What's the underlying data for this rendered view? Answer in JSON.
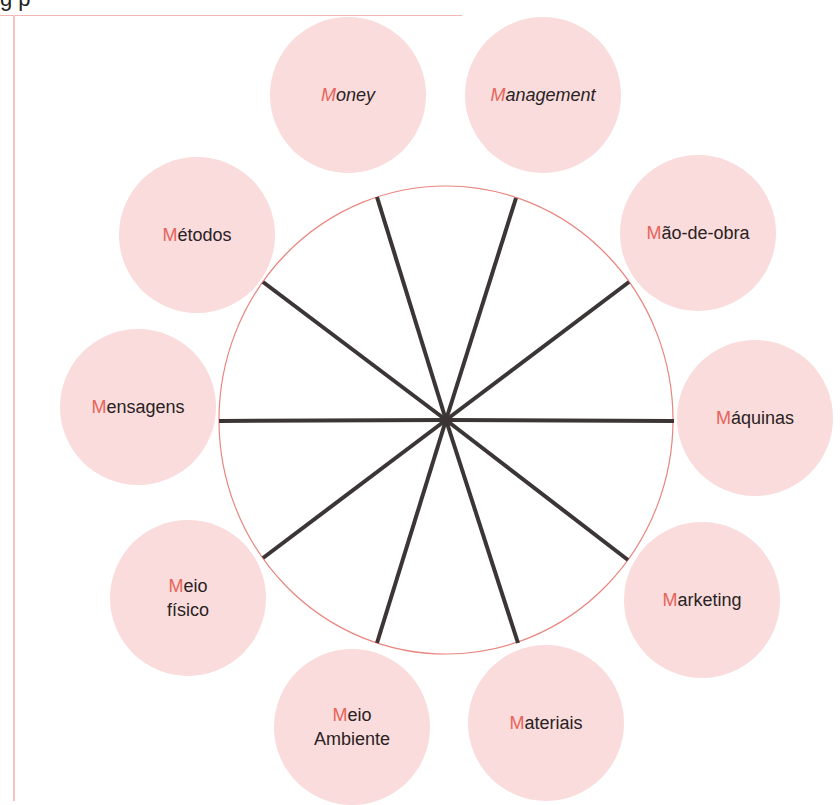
{
  "header": {
    "title_fragment": "g      p"
  },
  "colors": {
    "node_fill": "#f9dcdb",
    "accent_letter": "#e8635a",
    "text": "#2a2224",
    "ring_stroke": "#e8857f",
    "spoke": "#3b3536",
    "frame": "#f2b7b5"
  },
  "diagram": {
    "center": {
      "x": 446,
      "y": 420
    },
    "ring": {
      "rx": 227,
      "ry": 234
    },
    "nodes": [
      {
        "id": "money",
        "first": "M",
        "rest": "oney",
        "line2": "",
        "italic": true
      },
      {
        "id": "management",
        "first": "M",
        "rest": "anagement",
        "line2": "",
        "italic": true
      },
      {
        "id": "mao-de-obra",
        "first": "M",
        "rest": "ão-de-obra",
        "line2": "",
        "italic": false
      },
      {
        "id": "maquinas",
        "first": "M",
        "rest": "áquinas",
        "line2": "",
        "italic": false
      },
      {
        "id": "marketing",
        "first": "M",
        "rest": "arketing",
        "line2": "",
        "italic": false
      },
      {
        "id": "materiais",
        "first": "M",
        "rest": "ateriais",
        "line2": "",
        "italic": false
      },
      {
        "id": "meio-ambiente",
        "first": "M",
        "rest": "eio",
        "line2": "Ambiente",
        "italic": false
      },
      {
        "id": "meio-fisico",
        "first": "M",
        "rest": "eio",
        "line2": "físico",
        "italic": false
      },
      {
        "id": "mensagens",
        "first": "M",
        "rest": "ensagens",
        "line2": "",
        "italic": false
      },
      {
        "id": "metodos",
        "first": "M",
        "rest": "étodos",
        "line2": "",
        "italic": false
      }
    ]
  }
}
